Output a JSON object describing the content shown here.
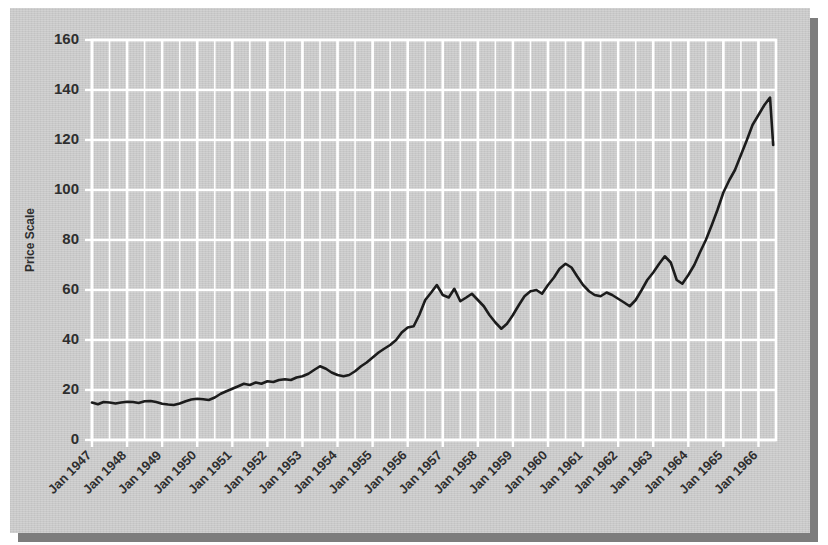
{
  "chart_data": {
    "type": "line",
    "title": "",
    "xlabel": "",
    "ylabel": "Price Scale",
    "ylim": [
      0,
      160
    ],
    "yticks": [
      0,
      20,
      40,
      60,
      80,
      100,
      120,
      140,
      160
    ],
    "ytick_labels": [
      "0",
      "20",
      "40",
      "60",
      "80",
      "100",
      "120",
      "140",
      "160"
    ],
    "xlim": [
      1947.0,
      1966.5
    ],
    "xticks": [
      1947,
      1948,
      1949,
      1950,
      1951,
      1952,
      1953,
      1954,
      1955,
      1956,
      1957,
      1958,
      1959,
      1960,
      1961,
      1962,
      1963,
      1964,
      1965,
      1966
    ],
    "xtick_labels": [
      "Jan 1947",
      "Jan 1948",
      "Jan 1949",
      "Jan 1950",
      "Jan 1951",
      "Jan 1952",
      "Jan 1953",
      "Jan 1954",
      "Jan 1955",
      "Jan 1956",
      "Jan 1957",
      "Jan 1958",
      "Jan 1959",
      "Jan 1960",
      "Jan 1961",
      "Jan 1962",
      "Jan 1963",
      "Jan 1964",
      "Jan 1965",
      "Jan 1966"
    ],
    "grid": true,
    "grid_color": "#ffffff",
    "minor_grid_interval_years": 0.5,
    "background_color": "#c9c9c9",
    "line_color": "#1c1c1c",
    "legend": null,
    "series": [
      {
        "name": "Price",
        "x": [
          1947.0,
          1947.17,
          1947.33,
          1947.5,
          1947.67,
          1947.83,
          1948.0,
          1948.17,
          1948.33,
          1948.5,
          1948.67,
          1948.83,
          1949.0,
          1949.17,
          1949.33,
          1949.5,
          1949.67,
          1949.83,
          1950.0,
          1950.17,
          1950.33,
          1950.5,
          1950.67,
          1950.83,
          1951.0,
          1951.17,
          1951.33,
          1951.5,
          1951.67,
          1951.83,
          1952.0,
          1952.17,
          1952.33,
          1952.5,
          1952.67,
          1952.83,
          1953.0,
          1953.17,
          1953.33,
          1953.5,
          1953.67,
          1953.83,
          1954.0,
          1954.17,
          1954.33,
          1954.5,
          1954.67,
          1954.83,
          1955.0,
          1955.17,
          1955.33,
          1955.5,
          1955.67,
          1955.83,
          1956.0,
          1956.17,
          1956.33,
          1956.5,
          1956.67,
          1956.83,
          1957.0,
          1957.17,
          1957.33,
          1957.5,
          1957.67,
          1957.83,
          1958.0,
          1958.17,
          1958.33,
          1958.5,
          1958.67,
          1958.83,
          1959.0,
          1959.17,
          1959.33,
          1959.5,
          1959.67,
          1959.83,
          1960.0,
          1960.17,
          1960.33,
          1960.5,
          1960.67,
          1960.83,
          1961.0,
          1961.17,
          1961.33,
          1961.5,
          1961.67,
          1961.83,
          1962.0,
          1962.17,
          1962.33,
          1962.5,
          1962.67,
          1962.83,
          1963.0,
          1963.17,
          1963.33,
          1963.5,
          1963.67,
          1963.83,
          1964.0,
          1964.17,
          1964.33,
          1964.5,
          1964.67,
          1964.83,
          1965.0,
          1965.17,
          1965.33,
          1965.5,
          1965.67,
          1965.83,
          1966.0,
          1966.17,
          1966.33,
          1966.42
        ],
        "values": [
          15.0,
          14.3,
          15.2,
          15.0,
          14.6,
          15.0,
          15.3,
          15.2,
          14.8,
          15.5,
          15.6,
          15.2,
          14.5,
          14.2,
          14.0,
          14.6,
          15.5,
          16.2,
          16.5,
          16.3,
          16.0,
          17.0,
          18.5,
          19.5,
          20.5,
          21.5,
          22.5,
          22.0,
          23.0,
          22.5,
          23.5,
          23.2,
          24.0,
          24.3,
          24.0,
          25.0,
          25.5,
          26.5,
          28.0,
          29.5,
          28.5,
          27.0,
          26.0,
          25.5,
          26.0,
          27.5,
          29.5,
          31.0,
          33.0,
          35.0,
          36.5,
          38.0,
          40.0,
          43.0,
          45.0,
          45.5,
          50.0,
          56.0,
          59.0,
          62.0,
          58.0,
          57.0,
          60.5,
          55.5,
          57.0,
          58.5,
          56.0,
          53.5,
          50.0,
          47.0,
          44.5,
          46.5,
          50.0,
          54.0,
          57.5,
          59.5,
          60.0,
          58.5,
          62.0,
          65.0,
          68.5,
          70.5,
          69.0,
          65.5,
          62.0,
          59.5,
          58.0,
          57.5,
          59.0,
          58.0,
          56.5,
          55.0,
          53.5,
          56.0,
          60.0,
          64.0,
          67.0,
          70.5,
          73.5,
          71.0,
          64.0,
          62.5,
          66.0,
          70.0,
          75.0,
          80.0,
          86.0,
          92.0,
          99.0,
          104.0,
          108.0,
          114.0,
          120.0,
          126.0,
          130.0,
          134.0,
          137.0,
          118.0
        ]
      }
    ],
    "series_detail_note": "Monthly-resolution price index, Jan 1947 - mid 1966"
  },
  "axes": {
    "y_title": "Price Scale"
  }
}
